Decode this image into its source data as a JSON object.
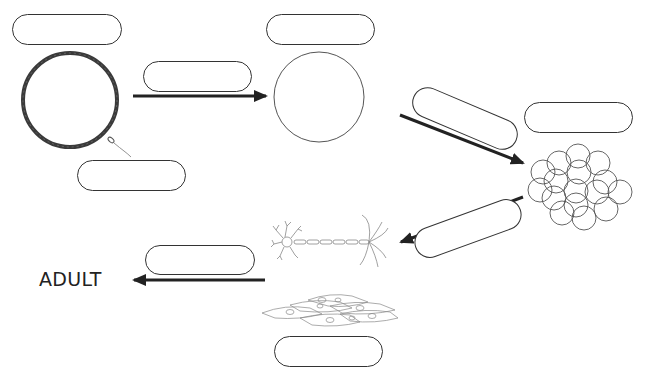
{
  "diagram": {
    "title": "",
    "type": "life-cycle / development stages",
    "stages": [
      {
        "id": "egg_and_sperm",
        "label": "",
        "drawing": "egg-cell-with-sperm"
      },
      {
        "id": "zygote",
        "label": "",
        "drawing": "single-cell-circle"
      },
      {
        "id": "embryo_cluster",
        "label": "",
        "drawing": "cell-cluster"
      },
      {
        "id": "specialized_cells",
        "label": "",
        "drawing": "nerve-cell-and-tissue-cells"
      },
      {
        "id": "adult",
        "label": "ADULT"
      }
    ],
    "blank_labels": [
      {
        "id": "blank-egg",
        "text": ""
      },
      {
        "id": "blank-sperm",
        "text": ""
      },
      {
        "id": "blank-fertilization",
        "text": ""
      },
      {
        "id": "blank-zygote",
        "text": ""
      },
      {
        "id": "blank-division",
        "text": ""
      },
      {
        "id": "blank-embryo",
        "text": ""
      },
      {
        "id": "blank-specialization",
        "text": ""
      },
      {
        "id": "blank-growth",
        "text": ""
      },
      {
        "id": "blank-tissue",
        "text": ""
      }
    ],
    "end_label": "ADULT",
    "colors": {
      "stroke": "#333333",
      "arrow": "#222222",
      "background": "#ffffff"
    }
  }
}
